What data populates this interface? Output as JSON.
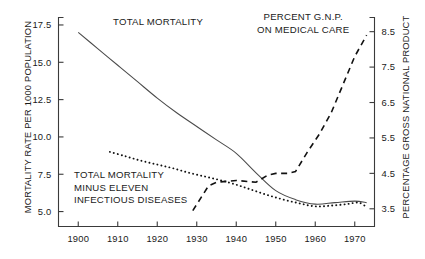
{
  "chart_data": {
    "type": "line",
    "title": "",
    "xlabel": "",
    "ylabel": "MORTALITY RATE PER 1000 POPULATION",
    "y2label": "PERCENTAGE GROSS NATIONAL PRODUCT",
    "xlim": [
      1895,
      1975
    ],
    "ylim": [
      4.0,
      18.0
    ],
    "y2lim": [
      3.0,
      8.9
    ],
    "grid": false,
    "legend_position": "inline-annotations",
    "xticks": [
      1900,
      1910,
      1920,
      1930,
      1940,
      1950,
      1960,
      1970
    ],
    "xticklabels": [
      "1900",
      "1910",
      "1920",
      "1930",
      "1940",
      "1950",
      "1960",
      "1970"
    ],
    "yticks": [
      5.0,
      7.5,
      10.0,
      12.5,
      15.0,
      17.5
    ],
    "yticklabels": [
      "5.0",
      "7.5",
      "10.0",
      "12.5",
      "15.0",
      "17.5"
    ],
    "y2ticks": [
      3.5,
      4.5,
      5.5,
      6.5,
      7.5,
      8.5
    ],
    "y2ticklabels": [
      "3.5",
      "4.5",
      "5.5",
      "6.5",
      "7.5",
      "8.5"
    ],
    "annotations": [
      {
        "text": "TOTAL MORTALITY",
        "series": "total_mortality"
      },
      {
        "text_line1": "PERCENT G.N.P.",
        "text_line2": "ON MEDICAL CARE",
        "series": "percent_gnp"
      },
      {
        "text_line1": "TOTAL MORTALITY",
        "text_line2": "MINUS ELEVEN",
        "text_line3": "INFECTIOUS DISEASES",
        "series": "mortality_minus_infectious"
      }
    ],
    "series": [
      {
        "name": "TOTAL MORTALITY",
        "axis": "left",
        "style": "solid",
        "color": "#4a4a4a",
        "x": [
          1900,
          1905,
          1910,
          1915,
          1920,
          1925,
          1930,
          1935,
          1940,
          1945,
          1950,
          1955,
          1960,
          1965,
          1970,
          1973
        ],
        "y": [
          17.0,
          15.9,
          14.8,
          13.7,
          12.6,
          11.6,
          10.7,
          9.8,
          8.9,
          7.6,
          6.4,
          5.8,
          5.5,
          5.6,
          5.7,
          5.6
        ]
      },
      {
        "name": "TOTAL MORTALITY MINUS ELEVEN INFECTIOUS DISEASES",
        "axis": "left",
        "style": "dotted",
        "color": "#111111",
        "x": [
          1908,
          1912,
          1916,
          1920,
          1924,
          1928,
          1932,
          1936,
          1940,
          1944,
          1948,
          1952,
          1956,
          1960,
          1964,
          1968,
          1971,
          1973
        ],
        "y": [
          9.0,
          8.7,
          8.4,
          8.15,
          7.9,
          7.6,
          7.35,
          7.1,
          6.8,
          6.45,
          6.1,
          5.8,
          5.55,
          5.35,
          5.4,
          5.5,
          5.6,
          5.3
        ]
      },
      {
        "name": "PERCENT G.N.P. ON MEDICAL CARE",
        "axis": "right",
        "style": "dashed",
        "color": "#111111",
        "x": [
          1929,
          1933,
          1935,
          1940,
          1945,
          1948,
          1950,
          1953,
          1955,
          1958,
          1961,
          1964,
          1967,
          1970,
          1973
        ],
        "y": [
          3.45,
          4.15,
          4.25,
          4.3,
          4.25,
          4.45,
          4.5,
          4.5,
          4.55,
          5.1,
          5.6,
          6.2,
          7.0,
          7.8,
          8.4
        ]
      }
    ]
  },
  "axes": {
    "left_title": "MORTALITY RATE PER 1000 POPULATION",
    "right_title": "PERCENTAGE GROSS NATIONAL PRODUCT"
  },
  "labels": {
    "total_mortality": "TOTAL MORTALITY",
    "gnp_line1": "PERCENT G.N.P.",
    "gnp_line2": "ON MEDICAL CARE",
    "minus_line1": "TOTAL MORTALITY",
    "minus_line2": "MINUS ELEVEN",
    "minus_line3": "INFECTIOUS DISEASES"
  },
  "colors": {
    "solid_series": "#4a4a4a",
    "dotted_series": "#111111",
    "dashed_series": "#111111",
    "axis": "#3a3a3a",
    "background": "#ffffff"
  }
}
